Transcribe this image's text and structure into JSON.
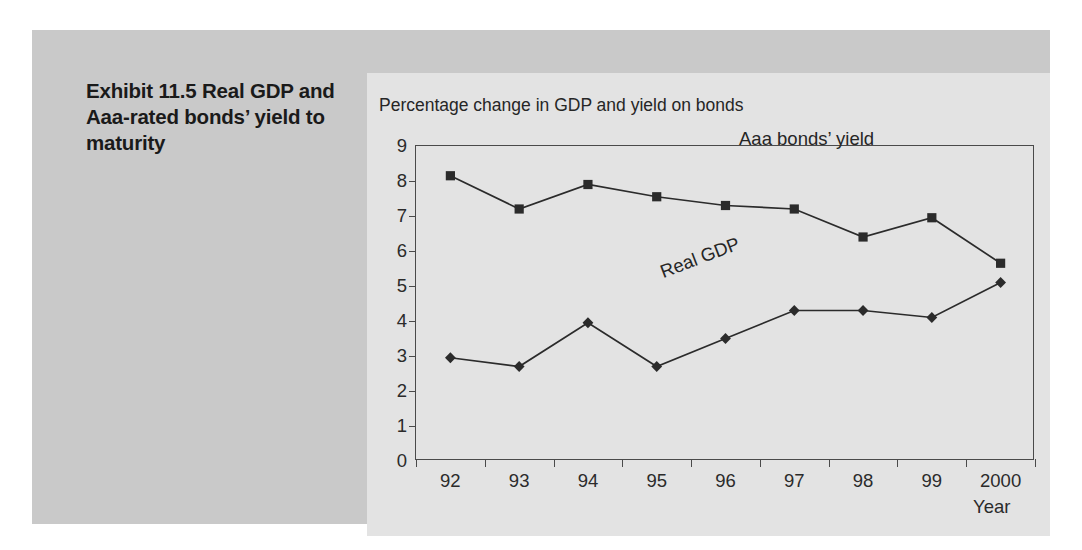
{
  "exhibit": {
    "caption": "Exhibit 11.5  Real GDP and Aaa-rated bonds’ yield to maturity"
  },
  "chart_data": {
    "type": "line",
    "title": "Percentage change in GDP and yield on bonds",
    "xlabel": "Year",
    "ylabel": "",
    "categories": [
      "92",
      "93",
      "94",
      "95",
      "96",
      "97",
      "98",
      "99",
      "2000"
    ],
    "ylim": [
      0,
      9
    ],
    "yticks": [
      0,
      1,
      2,
      3,
      4,
      5,
      6,
      7,
      8,
      9
    ],
    "grid": false,
    "legend": "inline-annotations",
    "series": [
      {
        "name": "Aaa bonds’ yield",
        "marker": "square",
        "color": "#2b2b2b",
        "values": [
          8.15,
          7.2,
          7.9,
          7.55,
          7.3,
          7.2,
          6.4,
          6.95,
          5.65
        ]
      },
      {
        "name": "Real GDP",
        "marker": "diamond",
        "color": "#2b2b2b",
        "values": [
          2.95,
          2.7,
          3.95,
          2.7,
          3.5,
          4.3,
          4.3,
          4.1,
          5.1
        ]
      }
    ],
    "annotations": [
      {
        "text": "Aaa bonds’ yield",
        "rotation": 0
      },
      {
        "text": "Real GDP",
        "rotation": -21
      }
    ]
  },
  "colors": {
    "outer_panel": "#c9c9c9",
    "chart_panel": "#e3e3e3",
    "ink": "#2b2b2b",
    "axis": "#4a4a4a"
  }
}
